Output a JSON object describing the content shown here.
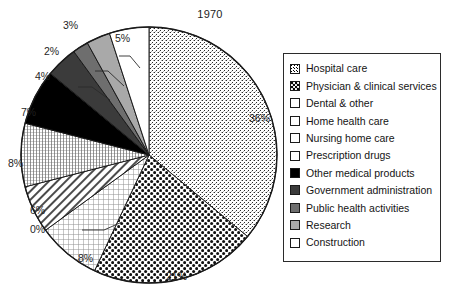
{
  "chart_data": {
    "type": "pie",
    "title": "1970",
    "xlabel": "",
    "ylabel": "",
    "legend_position": "right",
    "grid": false,
    "start_angle_deg": 0,
    "direction": "clockwise",
    "categories": [
      "Hospital care",
      "Physician & clinical services",
      "Dental & other",
      "Home health care",
      "Nursing home care",
      "Prescription drugs",
      "Other medical products",
      "Government administration",
      "Public health activities",
      "Research",
      "Construction"
    ],
    "values": [
      36,
      21,
      8,
      0,
      6,
      8,
      7,
      4,
      2,
      3,
      5
    ],
    "value_labels": [
      "36%",
      "21%",
      "8%",
      "0%",
      "6%",
      "8%",
      "7%",
      "4%",
      "2%",
      "3%",
      "5%"
    ],
    "units": "percent",
    "slices": [
      {
        "label": "Hospital care",
        "value": 36,
        "value_label": "36%",
        "fill": "stipple-fine",
        "swatch": "stipple-fine"
      },
      {
        "label": "Physician & clinical services",
        "value": 21,
        "value_label": "21%",
        "fill": "dots-coarse",
        "swatch": "dots-coarse"
      },
      {
        "label": "Dental & other",
        "value": 8,
        "value_label": "8%",
        "fill": "grid-light",
        "swatch": "grid-light"
      },
      {
        "label": "Home health care",
        "value": 0,
        "value_label": "0%",
        "fill": "solid-white",
        "swatch": "solid-white"
      },
      {
        "label": "Nursing home care",
        "value": 6,
        "value_label": "6%",
        "fill": "diagonal-lines",
        "swatch": "diagonal-lines"
      },
      {
        "label": "Prescription drugs",
        "value": 8,
        "value_label": "8%",
        "fill": "grid-dense",
        "swatch": "grid-dense"
      },
      {
        "label": "Other medical products",
        "value": 7,
        "value_label": "7%",
        "fill": "black",
        "swatch": "black"
      },
      {
        "label": "Government administration",
        "value": 4,
        "value_label": "4%",
        "fill": "gray-dark",
        "swatch": "gray-dark"
      },
      {
        "label": "Public health activities",
        "value": 2,
        "value_label": "2%",
        "fill": "gray-medium",
        "swatch": "gray-medium"
      },
      {
        "label": "Research",
        "value": 3,
        "value_label": "3%",
        "fill": "gray-light",
        "swatch": "gray-light"
      },
      {
        "label": "Construction",
        "value": 5,
        "value_label": "5%",
        "fill": "solid-white",
        "swatch": "solid-white"
      }
    ]
  },
  "colors": {
    "black": "#000000",
    "gray_dark": "#3b3b3b",
    "gray_medium": "#6e6e6e",
    "gray_light": "#a9a9a9",
    "white": "#ffffff",
    "outline": "#1a1a1a",
    "text": "#141414",
    "legend_border": "#2b2b2b"
  },
  "legend": {
    "items": [
      {
        "label": "Hospital care"
      },
      {
        "label": "Physician & clinical services"
      },
      {
        "label": "Dental & other"
      },
      {
        "label": "Home health care"
      },
      {
        "label": "Nursing home care"
      },
      {
        "label": "Prescription drugs"
      },
      {
        "label": "Other medical products"
      },
      {
        "label": "Government administration"
      },
      {
        "label": "Public health activities"
      },
      {
        "label": "Research"
      },
      {
        "label": "Construction"
      }
    ]
  },
  "labels": {
    "hospital": "36%",
    "physician": "21%",
    "dental": "8%",
    "home_health": "0%",
    "nursing": "6%",
    "prescription": "8%",
    "other_medical": "7%",
    "government": "4%",
    "public_health": "2%",
    "research": "3%",
    "construction": "5%"
  }
}
